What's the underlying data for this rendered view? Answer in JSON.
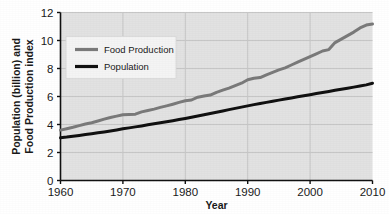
{
  "chart_data": {
    "type": "line",
    "title": "",
    "xlabel": "Year",
    "ylabel": "Population (billion) and Food Production index",
    "ylabel_line1": "Population (billion) and",
    "ylabel_line2": "Food Production index",
    "xlim": [
      1960,
      2010
    ],
    "ylim": [
      0,
      12
    ],
    "xticks": [
      1960,
      1970,
      1980,
      1990,
      2000,
      2010
    ],
    "xtick_labels": [
      "1960",
      "1970",
      "1980",
      "1990",
      "2000",
      "2010"
    ],
    "yticks": [
      0,
      2,
      4,
      6,
      8,
      10,
      12
    ],
    "ytick_labels": [
      "0",
      "2",
      "4",
      "6",
      "8",
      "10",
      "12"
    ],
    "grid": true,
    "grid_axis": "both",
    "legend_position": "upper-left",
    "plot_background": "#e2e2e2",
    "x": [
      1960,
      1961,
      1962,
      1963,
      1964,
      1965,
      1966,
      1967,
      1968,
      1969,
      1970,
      1971,
      1972,
      1973,
      1974,
      1975,
      1976,
      1977,
      1978,
      1979,
      1980,
      1981,
      1982,
      1983,
      1984,
      1985,
      1986,
      1987,
      1988,
      1989,
      1990,
      1991,
      1992,
      1993,
      1994,
      1995,
      1996,
      1997,
      1998,
      1999,
      2000,
      2001,
      2002,
      2003,
      2004,
      2005,
      2006,
      2007,
      2008,
      2009,
      2010
    ],
    "series": [
      {
        "name": "Food Production",
        "color": "#7a7a7a",
        "line_width": 3,
        "values": [
          3.6,
          3.7,
          3.8,
          3.92,
          4.03,
          4.13,
          4.25,
          4.38,
          4.5,
          4.6,
          4.7,
          4.72,
          4.74,
          4.9,
          5.0,
          5.1,
          5.22,
          5.33,
          5.45,
          5.58,
          5.7,
          5.75,
          5.95,
          6.03,
          6.1,
          6.3,
          6.45,
          6.6,
          6.78,
          6.95,
          7.2,
          7.3,
          7.35,
          7.55,
          7.72,
          7.9,
          8.05,
          8.25,
          8.45,
          8.65,
          8.85,
          9.05,
          9.25,
          9.35,
          9.85,
          10.1,
          10.35,
          10.6,
          10.9,
          11.1,
          11.18
        ]
      },
      {
        "name": "Population",
        "color": "#111111",
        "line_width": 3,
        "values": [
          3.05,
          3.1,
          3.16,
          3.22,
          3.28,
          3.34,
          3.41,
          3.47,
          3.54,
          3.61,
          3.69,
          3.76,
          3.83,
          3.9,
          3.98,
          4.05,
          4.12,
          4.19,
          4.27,
          4.35,
          4.43,
          4.52,
          4.6,
          4.69,
          4.78,
          4.87,
          4.96,
          5.06,
          5.15,
          5.24,
          5.33,
          5.42,
          5.5,
          5.58,
          5.66,
          5.74,
          5.82,
          5.9,
          5.98,
          6.05,
          6.13,
          6.21,
          6.29,
          6.36,
          6.44,
          6.52,
          6.59,
          6.67,
          6.75,
          6.83,
          6.95
        ]
      }
    ],
    "legend_entries": [
      {
        "label": "Food Production",
        "color": "#7a7a7a"
      },
      {
        "label": "Population",
        "color": "#111111"
      }
    ]
  }
}
